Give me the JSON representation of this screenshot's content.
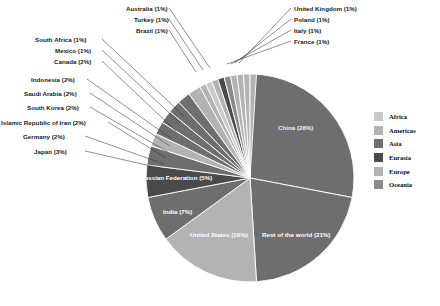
{
  "chart_data": {
    "type": "pie",
    "title": "",
    "total_percent": 100,
    "categories": [
      "China",
      "Rest of the world",
      "United States",
      "India",
      "Russian Federation",
      "Japan",
      "Germany",
      "Islamic Republic of Iran",
      "South Korea",
      "Saudi Arabia",
      "Indonesia",
      "Canada",
      "Mexico",
      "South Africa",
      "Brazil",
      "Turkey",
      "Australia",
      "France",
      "Italy",
      "Poland",
      "United Kingdom"
    ],
    "values": [
      28,
      21,
      16,
      7,
      5,
      3,
      2,
      2,
      2,
      2,
      2,
      2,
      1,
      1,
      1,
      1,
      1,
      1,
      1,
      1,
      1
    ],
    "legend_position": "right",
    "grid": false,
    "slices": [
      {
        "name": "China",
        "percent": 28,
        "label": "China (28%)",
        "group": "Asia",
        "color": "#6e6e6e",
        "label_inside": true,
        "label_color": "light"
      },
      {
        "name": "Rest of the world",
        "percent": 21,
        "label": "Rest of the world (21%)",
        "group": "Other",
        "color": "#6e6e6e",
        "label_inside": true,
        "label_color": "light"
      },
      {
        "name": "United States",
        "percent": 16,
        "label": "United States (16%)",
        "group": "Americas",
        "color": "#b3b3b3",
        "label_inside": true,
        "label_color": "light"
      },
      {
        "name": "India",
        "percent": 7,
        "label": "India (7%)",
        "group": "Asia",
        "color": "#6e6e6e",
        "label_inside": true,
        "label_color": "light"
      },
      {
        "name": "Russian Federation",
        "percent": 5,
        "label": "Russian Federation (5%)",
        "group": "Eurasia",
        "color": "#4a4a4a",
        "label_inside": true,
        "label_color": "light"
      },
      {
        "name": "Japan",
        "percent": 3,
        "label": "Japan (3%)",
        "group": "Asia",
        "color": "#6e6e6e",
        "label_inside": false
      },
      {
        "name": "Germany",
        "percent": 2,
        "label": "Germany (2%)",
        "group": "Europe",
        "color": "#b3b3b3",
        "label_inside": false
      },
      {
        "name": "Islamic Republic of Iran",
        "percent": 2,
        "label": "Islamic Republic of Iran (2%)",
        "group": "Asia",
        "color": "#6e6e6e",
        "label_inside": false
      },
      {
        "name": "South Korea",
        "percent": 2,
        "label": "South Korea (2%)",
        "group": "Asia",
        "color": "#6e6e6e",
        "label_inside": false
      },
      {
        "name": "Saudi Arabia",
        "percent": 2,
        "label": "Saudi Arabia (2%)",
        "group": "Asia",
        "color": "#6e6e6e",
        "label_inside": false
      },
      {
        "name": "Indonesia",
        "percent": 2,
        "label": "Indonesia (2%)",
        "group": "Asia",
        "color": "#6e6e6e",
        "label_inside": false
      },
      {
        "name": "Canada",
        "percent": 2,
        "label": "Canada (2%)",
        "group": "Americas",
        "color": "#b3b3b3",
        "label_inside": false
      },
      {
        "name": "Mexico",
        "percent": 1,
        "label": "Mexico (1%)",
        "group": "Americas",
        "color": "#b3b3b3",
        "label_inside": false
      },
      {
        "name": "South Africa",
        "percent": 1,
        "label": "South Africa (1%)",
        "group": "Africa",
        "color": "#c9c9c9",
        "label_inside": false
      },
      {
        "name": "Brazil",
        "percent": 1,
        "label": "Brazil (1%)",
        "group": "Americas",
        "color": "#b3b3b3",
        "label_inside": false
      },
      {
        "name": "Turkey",
        "percent": 1,
        "label": "Turkey (1%)",
        "group": "Eurasia",
        "color": "#4a4a4a",
        "label_inside": false
      },
      {
        "name": "Australia",
        "percent": 1,
        "label": "Australia (1%)",
        "group": "Oceania",
        "color": "#8a8a8a",
        "label_inside": false
      },
      {
        "name": "France",
        "percent": 1,
        "label": "France (1%)",
        "group": "Europe",
        "color": "#b3b3b3",
        "label_inside": false
      },
      {
        "name": "Italy",
        "percent": 1,
        "label": "Italy (1%)",
        "group": "Europe",
        "color": "#b3b3b3",
        "label_inside": false
      },
      {
        "name": "Poland",
        "percent": 1,
        "label": "Poland (1%)",
        "group": "Europe",
        "color": "#b3b3b3",
        "label_inside": false
      },
      {
        "name": "United Kingdom",
        "percent": 1,
        "label": "United Kingdom (1%)",
        "group": "Europe",
        "color": "#b3b3b3",
        "label_inside": false
      }
    ],
    "legend": [
      {
        "label": "Africa",
        "color": "#c9c9c9"
      },
      {
        "label": "Americas",
        "color": "#b3b3b3"
      },
      {
        "label": "Asia",
        "color": "#6e6e6e"
      },
      {
        "label": "Eurasia",
        "color": "#4a4a4a"
      },
      {
        "label": "Europe",
        "color": "#b3b3b3"
      },
      {
        "label": "Oceania",
        "color": "#8a8a8a"
      }
    ]
  },
  "inside_labels": [
    {
      "key": "china",
      "text": "China (28%)",
      "x": 278,
      "y": 124,
      "tone": "dark"
    },
    {
      "key": "row",
      "text": "Rest of the world (21%)",
      "x": 262,
      "y": 231,
      "tone": "light"
    },
    {
      "key": "usa",
      "text": "United States (16%)",
      "x": 190,
      "y": 231,
      "tone": "light"
    },
    {
      "key": "india",
      "text": "India (7%)",
      "x": 163,
      "y": 208,
      "tone": "light"
    },
    {
      "key": "russia",
      "text": "Russian Federation (5%)",
      "x": 140,
      "y": 174,
      "tone": "light"
    }
  ],
  "callouts_left": [
    {
      "key": "japan",
      "text": "Japan (3%)",
      "x": 34,
      "y": 148,
      "lx": 85,
      "ly": 151,
      "tx": 164,
      "ty": 169
    },
    {
      "key": "germany",
      "text": "Germany (2%)",
      "x": 23,
      "y": 133,
      "lx": 85,
      "ly": 136,
      "tx": 164,
      "ty": 164
    },
    {
      "key": "iran",
      "text": "Islamic Republic of Iran (2%)",
      "x": 1,
      "y": 119,
      "lx": 108,
      "ly": 122,
      "tx": 166,
      "ty": 158
    },
    {
      "key": "korea",
      "text": "South Korea (2%)",
      "x": 27,
      "y": 104,
      "lx": 90,
      "ly": 107,
      "tx": 168,
      "ty": 152
    },
    {
      "key": "saudi",
      "text": "Saudi Arabia (2%)",
      "x": 24,
      "y": 90,
      "lx": 90,
      "ly": 93,
      "tx": 170,
      "ty": 146
    },
    {
      "key": "indonesia",
      "text": "Indonesia (2%)",
      "x": 31,
      "y": 76,
      "lx": 87,
      "ly": 79,
      "tx": 172,
      "ty": 139
    },
    {
      "key": "canada",
      "text": "Canada (2%)",
      "x": 54,
      "y": 58,
      "lx": 102,
      "ly": 61,
      "tx": 176,
      "ty": 131
    },
    {
      "key": "mexico",
      "text": "Mexico (1%)",
      "x": 55,
      "y": 47,
      "lx": 102,
      "ly": 50,
      "tx": 180,
      "ty": 123
    },
    {
      "key": "safrica",
      "text": "South Africa (1%)",
      "x": 35,
      "y": 36,
      "lx": 102,
      "ly": 39,
      "tx": 184,
      "ty": 116
    },
    {
      "key": "brazil",
      "text": "Brazil (1%)",
      "x": 136,
      "y": 27,
      "lx": 169,
      "ly": 30,
      "tx": 196,
      "ty": 72
    },
    {
      "key": "turkey",
      "text": "Turkey (1%)",
      "x": 134,
      "y": 16,
      "lx": 169,
      "ly": 19,
      "tx": 203,
      "ty": 70
    },
    {
      "key": "australia",
      "text": "Australia (1%)",
      "x": 126,
      "y": 5,
      "lx": 169,
      "ly": 8,
      "tx": 210,
      "ty": 68
    }
  ],
  "callouts_right": [
    {
      "key": "uk",
      "text": "United Kingdom (1%)",
      "x": 294,
      "y": 5,
      "lx": 291,
      "ly": 8,
      "tx": 239,
      "ty": 63
    },
    {
      "key": "poland",
      "text": "Poland (1%)",
      "x": 294,
      "y": 16,
      "lx": 291,
      "ly": 19,
      "tx": 235,
      "ty": 63
    },
    {
      "key": "italy",
      "text": "Italy (1%)",
      "x": 294,
      "y": 27,
      "lx": 291,
      "ly": 30,
      "tx": 231,
      "ty": 64
    },
    {
      "key": "france",
      "text": "France (1%)",
      "x": 294,
      "y": 38,
      "lx": 291,
      "ly": 41,
      "tx": 227,
      "ty": 64
    }
  ],
  "geometry": {
    "cx": 250,
    "cy": 178,
    "r": 104,
    "start_angle_deg": -90
  }
}
